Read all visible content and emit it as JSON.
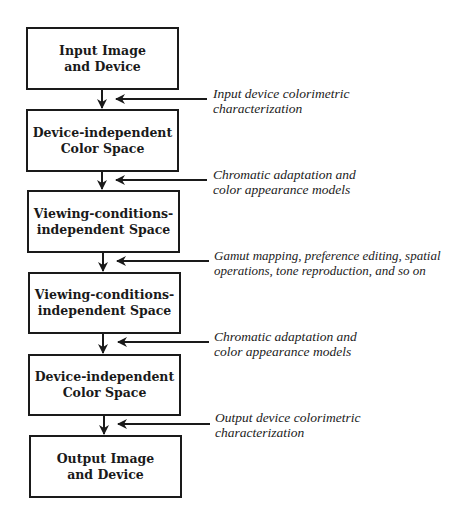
{
  "diagram": {
    "stages": [
      {
        "id": "input-image-device",
        "lines": [
          "Input Image",
          "and Device"
        ]
      },
      {
        "id": "device-independent-1",
        "lines": [
          "Device-independent",
          "Color Space"
        ]
      },
      {
        "id": "viewing-independent-1",
        "lines": [
          "Viewing-conditions-",
          "independent Space"
        ]
      },
      {
        "id": "viewing-independent-2",
        "lines": [
          "Viewing-conditions-",
          "independent Space"
        ]
      },
      {
        "id": "device-independent-2",
        "lines": [
          "Device-independent",
          "Color Space"
        ]
      },
      {
        "id": "output-image-device",
        "lines": [
          "Output Image",
          "and Device"
        ]
      }
    ],
    "transforms": [
      {
        "lines": [
          "Input device colorimetric",
          "characterization"
        ]
      },
      {
        "lines": [
          "Chromatic adaptation and",
          "color appearance models"
        ]
      },
      {
        "lines": [
          "Gamut mapping, preference editing, spatial",
          "operations, tone reproduction, and so on"
        ]
      },
      {
        "lines": [
          "Chromatic adaptation and",
          "color appearance models"
        ]
      },
      {
        "lines": [
          "Output device colorimetric",
          "characterization"
        ]
      }
    ],
    "colors": {
      "stroke": "#1a1a1a",
      "background": "#ffffff"
    }
  }
}
